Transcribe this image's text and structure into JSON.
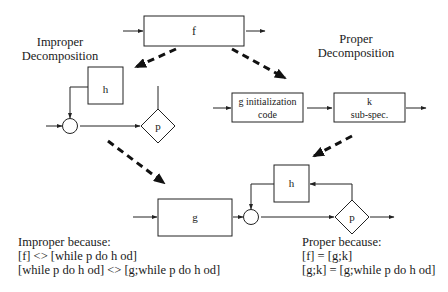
{
  "diagram": {
    "top": {
      "box_f_label": "f"
    },
    "improper": {
      "title_line1": "Improper",
      "title_line2": "Decomposition",
      "box_h_label": "h",
      "decision_label": "p"
    },
    "proper": {
      "title_line1": "Proper",
      "title_line2": "Decomposition",
      "init_box_line1": "g initialization",
      "init_box_line2": "code",
      "sub_box_line1": "k",
      "sub_box_line2": "sub-spec."
    },
    "bottom": {
      "box_g_label": "g",
      "box_h_label": "h",
      "decision_label": "p"
    },
    "notes": {
      "improper": {
        "title": "Improper because:",
        "line1": "[f] <> [while p do h od]",
        "line2": "[while p do h od] <> [g;while p do h od]"
      },
      "proper": {
        "title": "Proper because:",
        "line1": "[f] = [g;k]",
        "line2": "[g;k] = [g;while p do h od]"
      }
    }
  }
}
